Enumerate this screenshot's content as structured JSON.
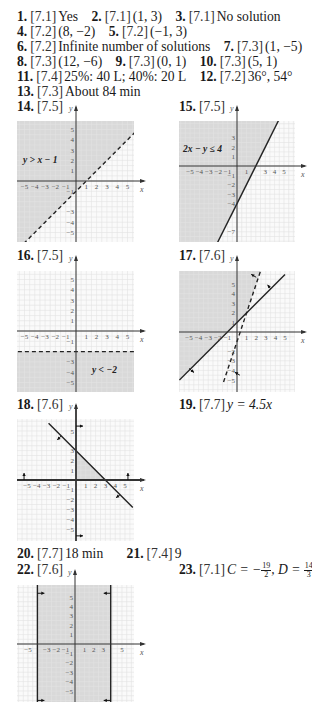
{
  "answers_text": [
    [
      {
        "num": "1.",
        "sec": "[7.1]",
        "val": "Yes"
      },
      {
        "num": "2.",
        "sec": "[7.1]",
        "val": "(1, 3)"
      },
      {
        "num": "3.",
        "sec": "[7.1]",
        "val": "No solution"
      }
    ],
    [
      {
        "num": "4.",
        "sec": "[7.2]",
        "val": "(8, −2)"
      },
      {
        "num": "5.",
        "sec": "[7.2]",
        "val": "(−1, 3)"
      }
    ],
    [
      {
        "num": "6.",
        "sec": "[7.2]",
        "val": "Infinite number of solutions"
      },
      {
        "num": "7.",
        "sec": "[7.3]",
        "val": "(1, −5)"
      }
    ],
    [
      {
        "num": "8.",
        "sec": "[7.3]",
        "val": "(12, −6)"
      },
      {
        "num": "9.",
        "sec": "[7.3]",
        "val": "(0, 1)"
      },
      {
        "num": "10.",
        "sec": "[7.3]",
        "val": "(5, 1)"
      }
    ],
    [
      {
        "num": "11.",
        "sec": "[7.4]",
        "val": "25%: 40 L; 40%: 20 L"
      },
      {
        "num": "12.",
        "sec": "[7.2]",
        "val": "36°, 54°"
      }
    ],
    [
      {
        "num": "13.",
        "sec": "[7.3]",
        "val": "About 84 min"
      }
    ]
  ],
  "a": {
    "l1": {
      "n1": "1.",
      "s1": "[7.1]",
      "v1": "Yes",
      "n2": "2.",
      "s2": "[7.1]",
      "v2": "(1, 3)",
      "n3": "3.",
      "s3": "[7.1]",
      "v3": "No solution"
    },
    "l2": {
      "n1": "4.",
      "s1": "[7.2]",
      "v1": "(8, −2)",
      "n2": "5.",
      "s2": "[7.2]",
      "v2": "(−1, 3)"
    },
    "l3": {
      "n1": "6.",
      "s1": "[7.2]",
      "v1": "Infinite number of solutions",
      "n2": "7.",
      "s2": "[7.3]",
      "v2": "(1, −5)"
    },
    "l4": {
      "n1": "8.",
      "s1": "[7.3]",
      "v1": "(12, −6)",
      "n2": "9.",
      "s2": "[7.3]",
      "v2": "(0, 1)",
      "n3": "10.",
      "s3": "[7.3]",
      "v3": "(5, 1)"
    },
    "l5": {
      "n1": "11.",
      "s1": "[7.4]",
      "v1": "25%: 40 L; 40%: 20 L",
      "n2": "12.",
      "s2": "[7.2]",
      "v2": "36°, 54°"
    },
    "l6": {
      "n1": "13.",
      "s1": "[7.3]",
      "v1": "About 84 min"
    }
  },
  "g14": {
    "num": "14.",
    "sec": "[7.5]",
    "label": "y > x − 1"
  },
  "g15": {
    "num": "15.",
    "sec": "[7.5]",
    "label": "2x − y ≤ 4"
  },
  "g16": {
    "num": "16.",
    "sec": "[7.5]",
    "label": "y < −2"
  },
  "g17": {
    "num": "17.",
    "sec": "[7.6]"
  },
  "g18": {
    "num": "18.",
    "sec": "[7.6]"
  },
  "g19": {
    "num": "19.",
    "sec": "[7.7]",
    "val": "y = 4.5x"
  },
  "g20": {
    "num": "20.",
    "sec": "[7.7]",
    "val": "18 min"
  },
  "g21": {
    "num": "21.",
    "sec": "[7.4]",
    "val": "9"
  },
  "g22": {
    "num": "22.",
    "sec": "[7.6]"
  },
  "g23": {
    "num": "23.",
    "sec": "[7.1]",
    "c_label": "C = −",
    "c_num": "19",
    "c_den": "2",
    "d_label": ", D = ",
    "d_num": "14",
    "d_den": "3"
  },
  "axis": {
    "x": "x",
    "y": "y"
  },
  "colors": {
    "shade": "#d9d9d9",
    "grid": "#e2e2e2",
    "axis": "#333333",
    "line": "#222222"
  }
}
